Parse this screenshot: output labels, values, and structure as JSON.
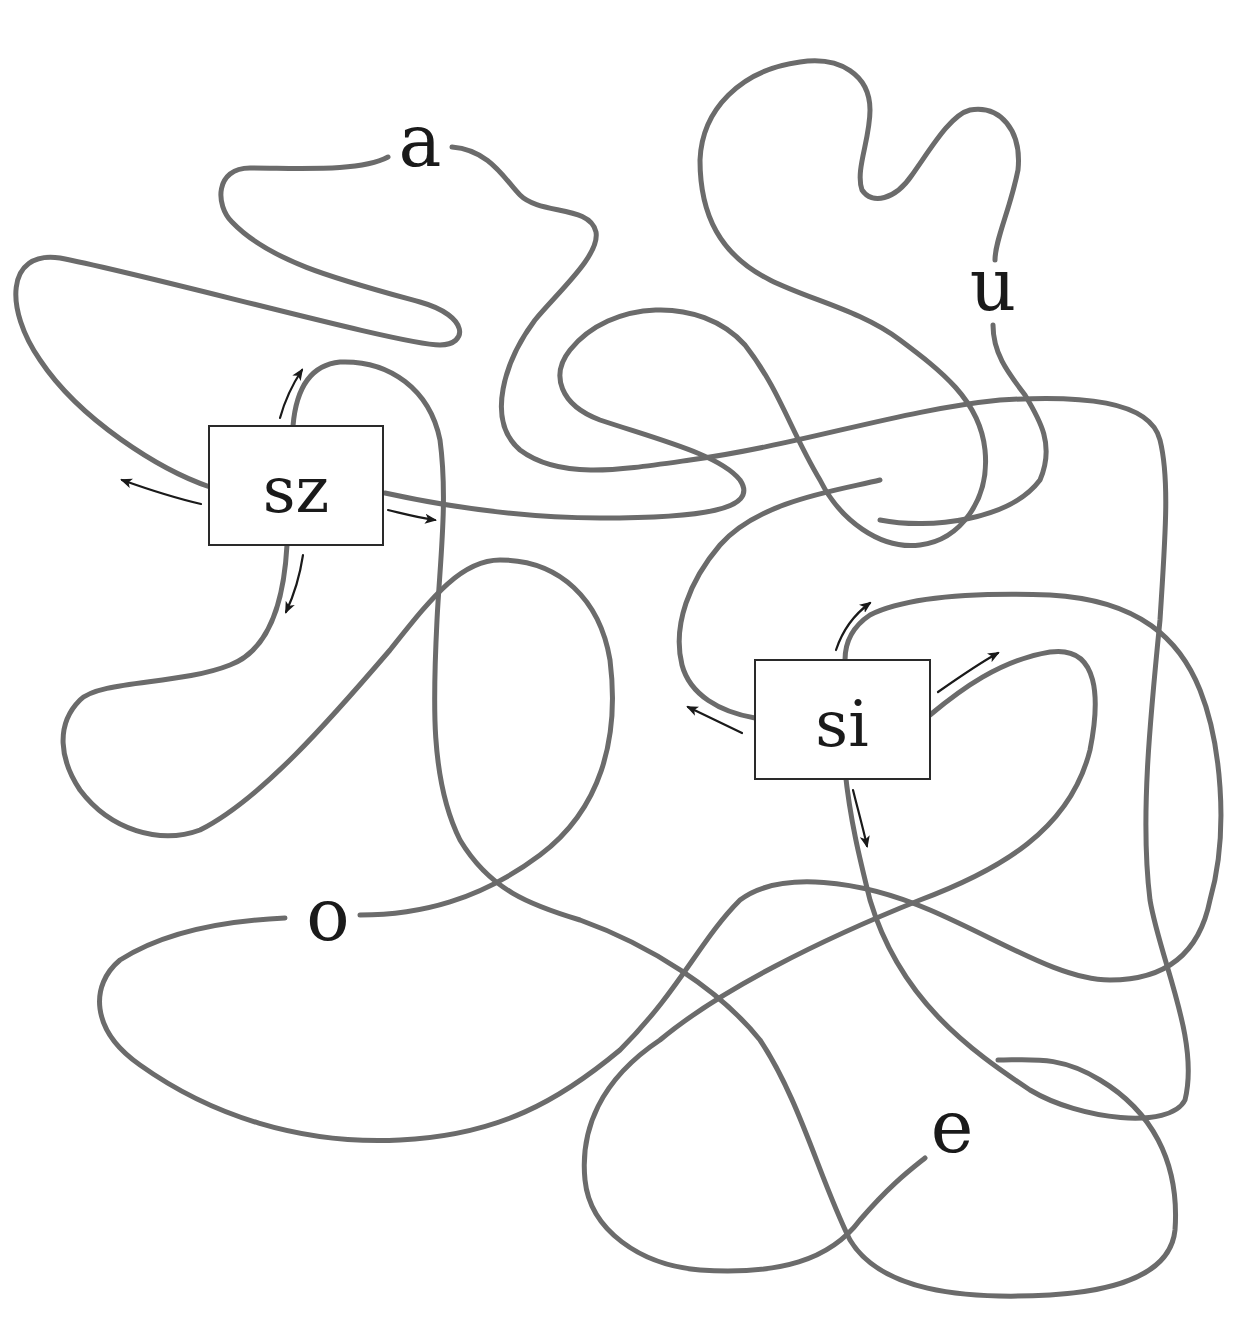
{
  "diagram": {
    "type": "tangle-knot-diagram",
    "colors": {
      "strand": "#6b6b6b",
      "arrow": "#1a1a1a",
      "box_border": "#2a2a2a",
      "text": "#1a1a1a",
      "background": "#ffffff"
    },
    "boxes": [
      {
        "id": "sz",
        "label": "sz",
        "arrows": [
          "left",
          "up",
          "right",
          "down"
        ]
      },
      {
        "id": "si",
        "label": "si",
        "arrows": [
          "left",
          "up",
          "up-right",
          "down"
        ]
      }
    ],
    "labels": [
      {
        "id": "a",
        "text": "a"
      },
      {
        "id": "u",
        "text": "u"
      },
      {
        "id": "o",
        "text": "o"
      },
      {
        "id": "e",
        "text": "e"
      }
    ]
  }
}
